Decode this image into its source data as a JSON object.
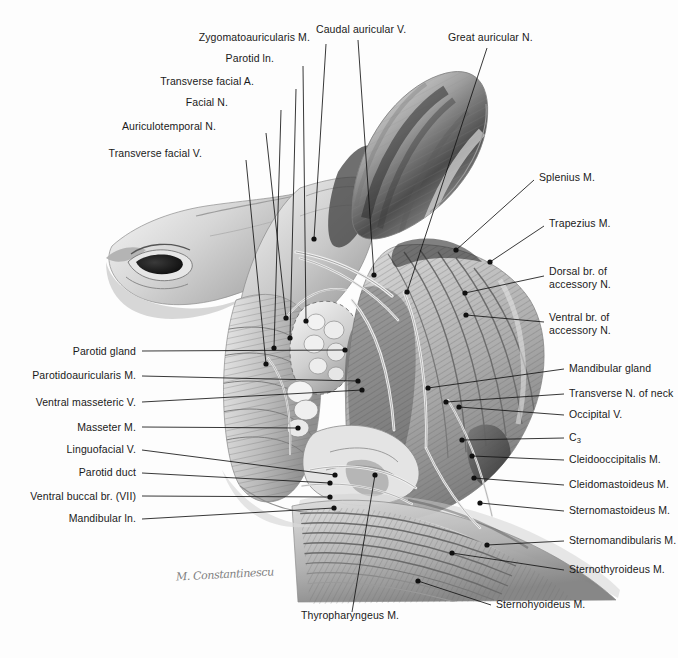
{
  "figure": {
    "domain": "anatomical-illustration",
    "medium": "graphite pencil drawing",
    "background_color": "#fdfdfd",
    "ink_color": "#141414",
    "partial_header_text": "",
    "signature": "M. Constantinescu"
  },
  "labels_left": [
    {
      "id": "zygomatoauricularis-m",
      "text": "Zygomatoauricularis M.",
      "x": 310,
      "y": 40,
      "tip_x": 314,
      "tip_y": 239
    },
    {
      "id": "parotid-ln",
      "text": "Parotid ln.",
      "x": 274,
      "y": 61,
      "tip_x": 306,
      "tip_y": 321
    },
    {
      "id": "transverse-facial-a",
      "text": "Transverse facial A.",
      "x": 254,
      "y": 84,
      "tip_x": 290,
      "tip_y": 338
    },
    {
      "id": "facial-n",
      "text": "Facial N.",
      "x": 228,
      "y": 105,
      "tip_x": 274,
      "tip_y": 348
    },
    {
      "id": "auriculotemporal-n",
      "text": "Auriculotemporal N.",
      "x": 216,
      "y": 129,
      "tip_x": 286,
      "tip_y": 318
    },
    {
      "id": "transverse-facial-v",
      "text": "Transverse facial V.",
      "x": 202,
      "y": 156,
      "tip_x": 266,
      "tip_y": 364
    },
    {
      "id": "parotid-gland",
      "text": "Parotid gland",
      "x": 136,
      "y": 354,
      "tip_x": 345,
      "tip_y": 350
    },
    {
      "id": "parotidoauricularis-m",
      "text": "Parotidoauricularis M.",
      "x": 136,
      "y": 378,
      "tip_x": 358,
      "tip_y": 381
    },
    {
      "id": "ventral-masseteric-v",
      "text": "Ventral masseteric V.",
      "x": 136,
      "y": 405,
      "tip_x": 362,
      "tip_y": 390
    },
    {
      "id": "masseter-m",
      "text": "Masseter M.",
      "x": 136,
      "y": 430,
      "tip_x": 298,
      "tip_y": 428
    },
    {
      "id": "linguofacial-v",
      "text": "Linguofacial V.",
      "x": 136,
      "y": 452,
      "tip_x": 335,
      "tip_y": 475
    },
    {
      "id": "parotid-duct",
      "text": "Parotid duct",
      "x": 136,
      "y": 475,
      "tip_x": 330,
      "tip_y": 483
    },
    {
      "id": "ventral-buccal-br-vii",
      "text": "Ventral buccal br. (VII)",
      "x": 136,
      "y": 499,
      "tip_x": 330,
      "tip_y": 497
    },
    {
      "id": "mandibular-ln",
      "text": "Mandibular ln.",
      "x": 136,
      "y": 521,
      "tip_x": 334,
      "tip_y": 508
    }
  ],
  "labels_right": [
    {
      "id": "great-auricular-n",
      "text": "Great auricular N.",
      "x": 448,
      "y": 40,
      "tip_x": 407,
      "tip_y": 292
    },
    {
      "id": "splenius-m",
      "text": "Splenius M.",
      "x": 539,
      "y": 180,
      "tip_x": 456,
      "tip_y": 250
    },
    {
      "id": "trapezius-m",
      "text": "Trapezius M.",
      "x": 549,
      "y": 226,
      "tip_x": 490,
      "tip_y": 262
    },
    {
      "id": "dorsal-br-accessory-n",
      "text": "Dorsal br. of\naccessory N.",
      "x": 549,
      "y": 274,
      "tip_x": 465,
      "tip_y": 293
    },
    {
      "id": "ventral-br-accessory-n",
      "text": "Ventral br. of\naccessory N.",
      "x": 549,
      "y": 320,
      "tip_x": 466,
      "tip_y": 315
    },
    {
      "id": "mandibular-gland",
      "text": "Mandibular gland",
      "x": 569,
      "y": 371,
      "tip_x": 428,
      "tip_y": 388
    },
    {
      "id": "transverse-n-of-neck",
      "text": "Transverse N. of neck",
      "x": 569,
      "y": 396,
      "tip_x": 446,
      "tip_y": 402
    },
    {
      "id": "occipital-v",
      "text": "Occipital V.",
      "x": 569,
      "y": 417,
      "tip_x": 459,
      "tip_y": 407
    },
    {
      "id": "c3",
      "text": "C",
      "sub": "3",
      "x": 569,
      "y": 440,
      "tip_x": 462,
      "tip_y": 440
    },
    {
      "id": "cleidooccipitalis-m",
      "text": "Cleidooccipitalis M.",
      "x": 569,
      "y": 462,
      "tip_x": 472,
      "tip_y": 456
    },
    {
      "id": "cleidomastoideus-m",
      "text": "Cleidomastoideus M.",
      "x": 569,
      "y": 487,
      "tip_x": 474,
      "tip_y": 478
    },
    {
      "id": "sternomastoideus-m",
      "text": "Sternomastoideus M.",
      "x": 569,
      "y": 513,
      "tip_x": 480,
      "tip_y": 503
    },
    {
      "id": "sternomandibularis-m",
      "text": "Sternomandibularis M.",
      "x": 569,
      "y": 543,
      "tip_x": 487,
      "tip_y": 545
    },
    {
      "id": "sternothyroideus-m",
      "text": "Sternothyroideus M.",
      "x": 569,
      "y": 572,
      "tip_x": 452,
      "tip_y": 553
    },
    {
      "id": "sternohyoideus-m",
      "text": "Sternohyoideus M.",
      "x": 496,
      "y": 607,
      "tip_x": 418,
      "tip_y": 581
    }
  ],
  "labels_bottom": [
    {
      "id": "thyropharyngeus-m",
      "text": "Thyropharyngeus M.",
      "x": 301,
      "y": 618,
      "tip_x": 375,
      "tip_y": 475
    },
    {
      "id": "caudal-auricular-v",
      "text": "Caudal auricular V.",
      "x": 316,
      "y": 32,
      "tip_x": 374,
      "tip_y": 275
    }
  ]
}
